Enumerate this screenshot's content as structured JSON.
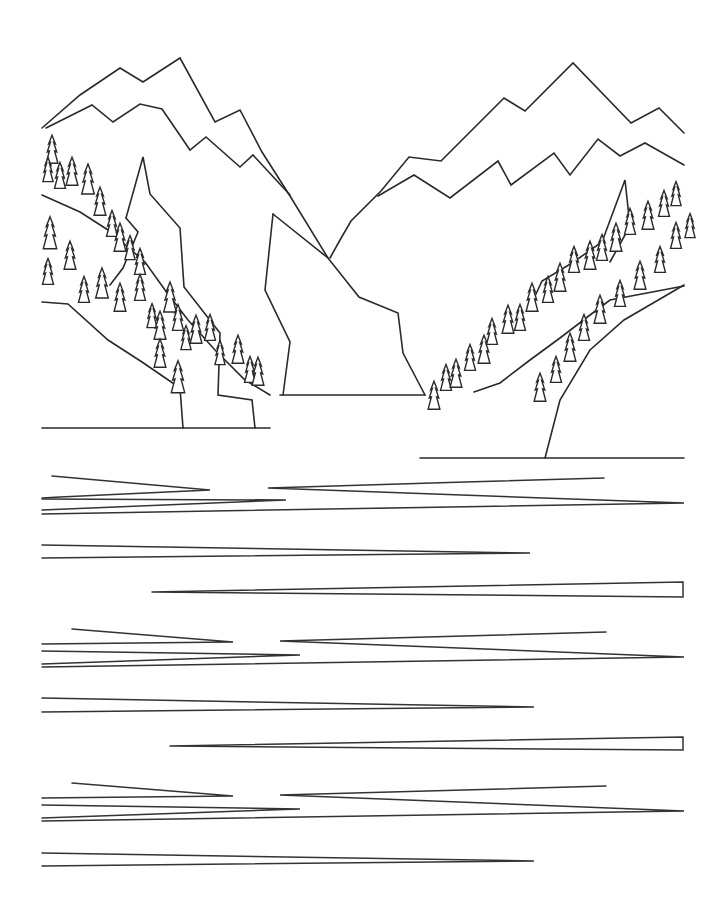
{
  "image": {
    "title": "Mountain lake line-art coloring page",
    "style": "black outline on white",
    "colors": {
      "line": "#2a2a2a",
      "background": "#ffffff"
    }
  },
  "scene": {
    "mountains": [
      {
        "name": "left-outer-ridge",
        "points": [
          [
            42,
            128
          ],
          [
            80,
            95
          ],
          [
            120,
            68
          ],
          [
            143,
            82
          ],
          [
            180,
            58
          ],
          [
            215,
            122
          ],
          [
            240,
            110
          ],
          [
            262,
            152
          ],
          [
            290,
            196
          ],
          [
            328,
            258
          ]
        ]
      },
      {
        "name": "left-inner-ridge",
        "points": [
          [
            46,
            128
          ],
          [
            92,
            105
          ],
          [
            113,
            122
          ],
          [
            140,
            104
          ],
          [
            162,
            109
          ],
          [
            190,
            150
          ],
          [
            206,
            137
          ],
          [
            240,
            167
          ],
          [
            253,
            155
          ],
          [
            290,
            195
          ]
        ]
      },
      {
        "name": "right-outer-ridge",
        "points": [
          [
            330,
            258
          ],
          [
            340,
            240
          ],
          [
            351,
            221
          ],
          [
            381,
            191
          ],
          [
            409,
            157
          ],
          [
            441,
            161
          ],
          [
            504,
            98
          ],
          [
            525,
            111
          ],
          [
            573,
            63
          ],
          [
            631,
            123
          ],
          [
            659,
            108
          ],
          [
            684,
            133
          ]
        ]
      },
      {
        "name": "right-inner-ridge",
        "points": [
          [
            378,
            196
          ],
          [
            414,
            175
          ],
          [
            450,
            198
          ],
          [
            498,
            161
          ],
          [
            511,
            185
          ],
          [
            554,
            153
          ],
          [
            570,
            175
          ],
          [
            598,
            139
          ],
          [
            620,
            156
          ],
          [
            645,
            143
          ],
          [
            684,
            165
          ]
        ]
      },
      {
        "name": "center-rock-left",
        "points": [
          [
            273,
            214
          ],
          [
            265,
            290
          ],
          [
            290,
            342
          ],
          [
            283,
            395
          ]
        ]
      },
      {
        "name": "center-rock-right",
        "points": [
          [
            273,
            214
          ],
          [
            328,
            258
          ],
          [
            359,
            297
          ],
          [
            398,
            313
          ],
          [
            403,
            353
          ],
          [
            425,
            395
          ]
        ]
      },
      {
        "name": "left-cliff",
        "points": [
          [
            126,
            218
          ],
          [
            143,
            157
          ],
          [
            150,
            194
          ],
          [
            180,
            228
          ],
          [
            184,
            287
          ],
          [
            220,
            333
          ],
          [
            218,
            395
          ],
          [
            252,
            400
          ],
          [
            255,
            428
          ]
        ]
      },
      {
        "name": "left-cliff-inner",
        "points": [
          [
            126,
            218
          ],
          [
            138,
            232
          ],
          [
            123,
            268
          ],
          [
            110,
            285
          ]
        ]
      },
      {
        "name": "right-cliff",
        "points": [
          [
            530,
            307
          ],
          [
            542,
            281
          ],
          [
            572,
            263
          ],
          [
            602,
            242
          ],
          [
            625,
            180
          ],
          [
            630,
            226
          ],
          [
            610,
            262
          ]
        ]
      },
      {
        "name": "left-slope-upper",
        "points": [
          [
            42,
            195
          ],
          [
            80,
            212
          ],
          [
            108,
            230
          ],
          [
            145,
            262
          ],
          [
            165,
            290
          ],
          [
            188,
            320
          ],
          [
            215,
            350
          ],
          [
            245,
            380
          ],
          [
            270,
            395
          ]
        ]
      },
      {
        "name": "left-slope-lower",
        "points": [
          [
            42,
            302
          ],
          [
            68,
            304
          ],
          [
            108,
            340
          ],
          [
            142,
            362
          ],
          [
            180,
            388
          ],
          [
            183,
            428
          ]
        ]
      },
      {
        "name": "right-slope-upper",
        "points": [
          [
            474,
            392
          ],
          [
            500,
            383
          ],
          [
            530,
            360
          ],
          [
            560,
            338
          ],
          [
            590,
            315
          ],
          [
            610,
            300
          ],
          [
            684,
            286
          ]
        ]
      },
      {
        "name": "right-slope-lower",
        "points": [
          [
            545,
            458
          ],
          [
            560,
            400
          ],
          [
            590,
            350
          ],
          [
            624,
            320
          ],
          [
            684,
            285
          ]
        ]
      }
    ],
    "shorelines": [
      {
        "name": "far-shore",
        "from": [
          280,
          395
        ],
        "to": [
          425,
          395
        ]
      },
      {
        "name": "left-shore",
        "from": [
          42,
          428
        ],
        "to": [
          270,
          428
        ]
      },
      {
        "name": "right-shore",
        "from": [
          420,
          458
        ],
        "to": [
          684,
          458
        ]
      }
    ],
    "trees": {
      "left": [
        [
          52,
          152,
          14
        ],
        [
          48,
          172,
          12
        ],
        [
          60,
          178,
          13
        ],
        [
          72,
          174,
          14
        ],
        [
          88,
          182,
          15
        ],
        [
          100,
          204,
          14
        ],
        [
          112,
          226,
          13
        ],
        [
          120,
          240,
          14
        ],
        [
          130,
          250,
          12
        ],
        [
          140,
          264,
          13
        ],
        [
          50,
          236,
          16
        ],
        [
          48,
          274,
          13
        ],
        [
          70,
          258,
          14
        ],
        [
          84,
          292,
          13
        ],
        [
          102,
          286,
          15
        ],
        [
          120,
          300,
          14
        ],
        [
          140,
          290,
          13
        ],
        [
          152,
          318,
          12
        ],
        [
          160,
          328,
          14
        ],
        [
          170,
          300,
          15
        ],
        [
          178,
          320,
          13
        ],
        [
          186,
          340,
          12
        ],
        [
          196,
          332,
          14
        ],
        [
          210,
          330,
          13
        ],
        [
          220,
          355,
          12
        ],
        [
          238,
          352,
          14
        ],
        [
          250,
          372,
          13
        ],
        [
          258,
          374,
          14
        ],
        [
          178,
          380,
          16
        ],
        [
          160,
          356,
          14
        ]
      ],
      "right": [
        [
          434,
          398,
          14
        ],
        [
          446,
          380,
          13
        ],
        [
          456,
          376,
          14
        ],
        [
          470,
          360,
          13
        ],
        [
          484,
          352,
          14
        ],
        [
          492,
          334,
          13
        ],
        [
          508,
          322,
          14
        ],
        [
          520,
          320,
          13
        ],
        [
          532,
          300,
          14
        ],
        [
          548,
          292,
          13
        ],
        [
          560,
          280,
          14
        ],
        [
          574,
          262,
          13
        ],
        [
          590,
          258,
          14
        ],
        [
          602,
          250,
          13
        ],
        [
          616,
          240,
          14
        ],
        [
          630,
          224,
          13
        ],
        [
          648,
          218,
          14
        ],
        [
          664,
          206,
          13
        ],
        [
          676,
          196,
          12
        ],
        [
          540,
          390,
          14
        ],
        [
          556,
          372,
          13
        ],
        [
          570,
          350,
          14
        ],
        [
          584,
          330,
          13
        ],
        [
          600,
          312,
          14
        ],
        [
          620,
          296,
          13
        ],
        [
          640,
          278,
          14
        ],
        [
          660,
          262,
          13
        ],
        [
          676,
          238,
          13
        ],
        [
          690,
          228,
          12
        ]
      ]
    },
    "water_lines": [
      {
        "y": 476,
        "segments": [
          [
            [
              52,
              476
            ],
            [
              210,
              490
            ],
            [
              60,
              497
            ],
            [
              42,
              498
            ]
          ],
          [
            [
              604,
              478
            ],
            [
              465,
              482
            ],
            [
              268,
              488
            ],
            [
              684,
              503
            ],
            [
              42,
              514
            ]
          ]
        ]
      },
      {
        "y": 496,
        "segments": [
          [
            [
              42,
              499
            ],
            [
              286,
              500
            ],
            [
              42,
              510
            ]
          ]
        ]
      },
      {
        "y": 545,
        "segments": [
          [
            [
              42,
              545
            ],
            [
              530,
              553
            ],
            [
              42,
              558
            ]
          ]
        ]
      },
      {
        "y": 590,
        "segments": [
          [
            [
              152,
              592
            ],
            [
              683,
              582
            ],
            [
              683,
              597
            ],
            [
              152,
              592
            ]
          ]
        ]
      },
      {
        "y": 630,
        "segments": [
          [
            [
              72,
              629
            ],
            [
              233,
              642
            ],
            [
              42,
              644
            ]
          ],
          [
            [
              606,
              632
            ],
            [
              280,
              641
            ],
            [
              684,
              657
            ],
            [
              42,
              667
            ]
          ]
        ]
      },
      {
        "y": 651,
        "segments": [
          [
            [
              42,
              651
            ],
            [
              300,
              655
            ],
            [
              42,
              664
            ]
          ]
        ]
      },
      {
        "y": 698,
        "segments": [
          [
            [
              42,
              698
            ],
            [
              534,
              707
            ],
            [
              42,
              712
            ]
          ]
        ]
      },
      {
        "y": 744,
        "segments": [
          [
            [
              170,
              746
            ],
            [
              683,
              737
            ],
            [
              683,
              750
            ],
            [
              170,
              746
            ]
          ]
        ]
      },
      {
        "y": 783,
        "segments": [
          [
            [
              72,
              783
            ],
            [
              233,
              796
            ],
            [
              42,
              798
            ]
          ],
          [
            [
              606,
              786
            ],
            [
              280,
              795
            ],
            [
              684,
              811
            ],
            [
              42,
              821
            ]
          ]
        ]
      },
      {
        "y": 805,
        "segments": [
          [
            [
              42,
              805
            ],
            [
              300,
              809
            ],
            [
              42,
              818
            ]
          ]
        ]
      },
      {
        "y": 853,
        "segments": [
          [
            [
              42,
              853
            ],
            [
              534,
              861
            ],
            [
              42,
              866
            ]
          ]
        ]
      }
    ]
  }
}
